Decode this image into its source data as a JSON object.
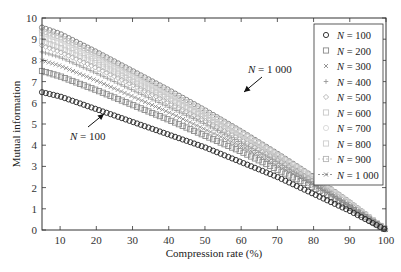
{
  "chart_data": {
    "type": "line",
    "title": "",
    "xlabel": "Compression rate (%)",
    "ylabel": "Mutual information",
    "xlim": [
      5,
      100
    ],
    "ylim": [
      0,
      10
    ],
    "xticks": [
      10,
      20,
      30,
      40,
      50,
      60,
      70,
      80,
      90,
      100
    ],
    "yticks": [
      0,
      1,
      2,
      3,
      4,
      5,
      6,
      7,
      8,
      9,
      10
    ],
    "grid": false,
    "legend_position": "top-right",
    "x": [
      5,
      10,
      20,
      30,
      40,
      50,
      60,
      70,
      80,
      90,
      100
    ],
    "series": [
      {
        "name": "N = 100",
        "italic_var": "N",
        "value_text": " = 100",
        "marker": "circle",
        "color": "#222222",
        "values": [
          6.5,
          6.3,
          5.7,
          5.1,
          4.5,
          3.9,
          3.2,
          2.5,
          1.7,
          0.9,
          0.0
        ]
      },
      {
        "name": "N = 200",
        "italic_var": "N",
        "value_text": " = 200",
        "marker": "square",
        "color": "#8a8a8a",
        "values": [
          7.5,
          7.25,
          6.6,
          5.9,
          5.2,
          4.45,
          3.7,
          2.85,
          2.0,
          1.05,
          0.0
        ]
      },
      {
        "name": "N = 300",
        "italic_var": "N",
        "value_text": " = 300",
        "marker": "x",
        "color": "#8a8a8a",
        "values": [
          8.0,
          7.75,
          7.05,
          6.3,
          5.55,
          4.75,
          3.95,
          3.05,
          2.1,
          1.1,
          0.0
        ]
      },
      {
        "name": "N = 400",
        "italic_var": "N",
        "value_text": " = 400",
        "marker": "plus",
        "color": "#999999",
        "values": [
          8.4,
          8.15,
          7.4,
          6.6,
          5.8,
          5.0,
          4.1,
          3.2,
          2.2,
          1.15,
          0.0
        ]
      },
      {
        "name": "N = 500",
        "italic_var": "N",
        "value_text": " = 500",
        "marker": "diamond",
        "color": "#b0b0b0",
        "values": [
          8.7,
          8.4,
          7.65,
          6.85,
          6.0,
          5.15,
          4.25,
          3.3,
          2.3,
          1.2,
          0.0
        ]
      },
      {
        "name": "N = 600",
        "italic_var": "N",
        "value_text": " = 600",
        "marker": "square",
        "color": "#c8c8c8",
        "values": [
          8.9,
          8.6,
          7.85,
          7.0,
          6.15,
          5.3,
          4.35,
          3.4,
          2.35,
          1.2,
          0.0
        ]
      },
      {
        "name": "N = 700",
        "italic_var": "N",
        "value_text": " = 700",
        "marker": "circle",
        "color": "#d8d8d8",
        "values": [
          9.1,
          8.8,
          8.0,
          7.15,
          6.3,
          5.4,
          4.45,
          3.45,
          2.4,
          1.25,
          0.0
        ]
      },
      {
        "name": "N = 800",
        "italic_var": "N",
        "value_text": " = 800",
        "marker": "square",
        "color": "#cccccc",
        "values": [
          9.3,
          9.0,
          8.2,
          7.3,
          6.45,
          5.5,
          4.55,
          3.5,
          2.45,
          1.25,
          0.0
        ]
      },
      {
        "name": "N = 900",
        "italic_var": "N",
        "value_text": " = 900",
        "marker": "circle-dash",
        "color": "#b5b5b5",
        "values": [
          9.4,
          9.1,
          8.3,
          7.4,
          6.5,
          5.55,
          4.6,
          3.55,
          2.45,
          1.3,
          0.0
        ]
      },
      {
        "name": "N = 1000",
        "italic_var": "N",
        "value_text": " = 1 000",
        "marker": "circle-dash",
        "color": "#7a7a7a",
        "values": [
          9.55,
          9.25,
          8.4,
          7.5,
          6.6,
          5.65,
          4.65,
          3.6,
          2.5,
          1.3,
          0.0
        ]
      }
    ],
    "annotations": [
      {
        "text_var": "N",
        "text_rest": " = 1 000",
        "points_to_series": "N = 1000",
        "at_x": 35
      },
      {
        "text_var": "N",
        "text_rest": " = 100",
        "points_to_series": "N = 100",
        "at_x": 20
      }
    ]
  }
}
